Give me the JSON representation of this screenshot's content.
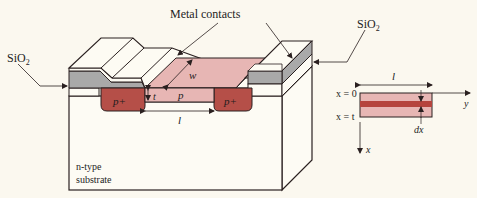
{
  "diagram": {
    "labels": {
      "metal_contacts": "Metal contacts",
      "sio2_left": "SiO",
      "sio2_left_sub": "2",
      "sio2_right": "SiO",
      "sio2_right_sub": "2",
      "w": "w",
      "t": "t",
      "p": "p",
      "p_plus_left": "p+",
      "p_plus_right": "p+",
      "l_main": "l",
      "substrate_line1": "n-type",
      "substrate_line2": "substrate"
    },
    "inset": {
      "l": "l",
      "x0": "x = 0",
      "xt": "x = t",
      "y_axis": "y",
      "x_axis": "x",
      "dx": "dx"
    },
    "colors": {
      "background": "#fbf8ef",
      "p_region": "#e7b6b4",
      "p_plus": "#b54f48",
      "oxide": "#a9a9a9",
      "metal": "#fdfbf3",
      "outline": "#2a2020",
      "dx_slice": "#b5443e"
    }
  }
}
